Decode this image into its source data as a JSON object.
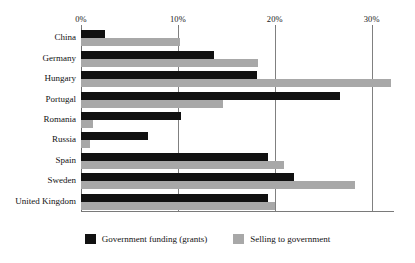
{
  "chart_data": {
    "type": "bar",
    "orientation": "horizontal",
    "title": "",
    "subtitle": "",
    "xlabel": "",
    "ylabel": "",
    "xlim": [
      0,
      32.3
    ],
    "xticks": [
      0,
      10,
      20,
      30
    ],
    "xticklabels": [
      "0%",
      "10%",
      "20%",
      "30%"
    ],
    "grid": true,
    "legend_position": "bottom",
    "categories": [
      "China",
      "Germany",
      "Hungary",
      "Portugal",
      "Romania",
      "Russia",
      "Spain",
      "Sweden",
      "United Kingdom"
    ],
    "series": [
      {
        "name": "Government funding (grants)",
        "color": "#111111",
        "values": [
          2.5,
          13.7,
          18.2,
          26.7,
          10.3,
          6.9,
          19.3,
          22.0,
          19.3
        ]
      },
      {
        "name": "Selling to government",
        "color": "#a8a8a8",
        "values": [
          10.2,
          18.3,
          32.0,
          14.7,
          1.2,
          0.9,
          21.0,
          28.3,
          20.0
        ]
      }
    ]
  },
  "axis": {
    "ticks": [
      {
        "label": "0%",
        "value": 0
      },
      {
        "label": "10%",
        "value": 10
      },
      {
        "label": "20%",
        "value": 20
      },
      {
        "label": "30%",
        "value": 30
      }
    ]
  },
  "legend": {
    "entries": [
      {
        "label": "Government funding (grants)",
        "color": "#111111"
      },
      {
        "label": "Selling to government",
        "color": "#a8a8a8"
      }
    ]
  },
  "colors": {
    "series_a": "#111111",
    "series_b": "#a8a8a8",
    "gridline": "#808080",
    "axis": "#7a7a7a",
    "background": "#ffffff",
    "text": "#121212"
  }
}
